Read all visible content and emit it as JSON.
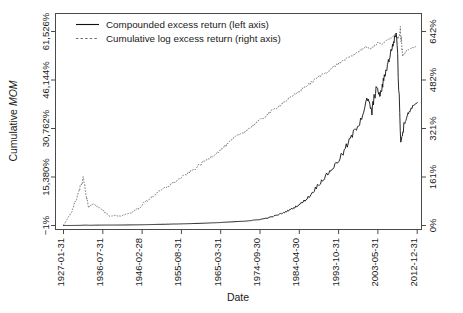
{
  "chart_data": {
    "type": "line",
    "title": "",
    "xlabel": "Date",
    "ylabel": "Cumulative MOM",
    "ylabel_plain": "Cumulative ",
    "ylabel_italic": "MOM",
    "grid": false,
    "legend_position": "top-left",
    "x_tick_labels": [
      "1927-01-31",
      "1936-07-31",
      "1946-02-28",
      "1955-08-31",
      "1965-03-31",
      "1974-09-30",
      "1984-04-30",
      "1993-10-31",
      "2003-05-31",
      "2012-12-31"
    ],
    "left_axis": {
      "label": "Cumulative MOM",
      "tick_labels": [
        "−1%",
        "15,380%",
        "30,762%",
        "46,144%",
        "61,526%"
      ],
      "tick_values": [
        -1,
        15380,
        30762,
        46144,
        61526
      ],
      "ylim": [
        -1,
        61526
      ],
      "units": "percent"
    },
    "right_axis": {
      "tick_labels": [
        "0%",
        "161%",
        "321%",
        "482%",
        "642%"
      ],
      "tick_values": [
        0,
        161,
        321,
        482,
        642
      ],
      "ylim": [
        0,
        642
      ],
      "units": "percent"
    },
    "series": [
      {
        "name": "Compounded excess return (left axis)",
        "axis": "left",
        "style": "solid",
        "color": "#111111",
        "x": [
          1927.08,
          1929.0,
          1931.0,
          1932.5,
          1933.5,
          1935.0,
          1937.0,
          1939.0,
          1941.0,
          1943.0,
          1945.0,
          1947.0,
          1949.0,
          1951.0,
          1953.0,
          1955.0,
          1957.0,
          1959.0,
          1961.0,
          1963.0,
          1965.0,
          1967.0,
          1969.0,
          1971.0,
          1973.0,
          1975.0,
          1977.0,
          1979.0,
          1981.0,
          1983.0,
          1985.0,
          1987.0,
          1989.0,
          1991.0,
          1993.0,
          1995.0,
          1997.0,
          1999.0,
          2001.0,
          2002.0,
          2003.0,
          2004.0,
          2005.0,
          2006.0,
          2007.0,
          2008.0,
          2009.0,
          2010.0,
          2011.0,
          2012.0,
          2013.0
        ],
        "y": [
          0,
          10,
          40,
          120,
          60,
          110,
          130,
          140,
          150,
          180,
          210,
          260,
          320,
          380,
          430,
          500,
          560,
          640,
          720,
          820,
          930,
          1080,
          1220,
          1380,
          1620,
          1950,
          2500,
          3300,
          4300,
          5600,
          7200,
          9500,
          13000,
          16000,
          19000,
          23000,
          28000,
          33000,
          40000,
          36000,
          44000,
          41000,
          47000,
          52000,
          57000,
          61500,
          27000,
          33000,
          36000,
          38000,
          39000
        ]
      },
      {
        "name": "Cumulative log excess return (right axis)",
        "axis": "right",
        "style": "dashed",
        "color": "#6b6b6b",
        "x": [
          1927.08,
          1928.0,
          1929.0,
          1930.0,
          1931.0,
          1932.0,
          1932.6,
          1933.2,
          1933.8,
          1934.5,
          1935.5,
          1936.5,
          1937.5,
          1938.5,
          1939.5,
          1940.5,
          1941.5,
          1942.5,
          1943.5,
          1945.0,
          1947.0,
          1949.0,
          1951.0,
          1953.0,
          1955.0,
          1957.0,
          1959.0,
          1961.0,
          1963.0,
          1965.0,
          1967.0,
          1969.0,
          1971.0,
          1973.0,
          1975.0,
          1977.0,
          1979.0,
          1981.0,
          1983.0,
          1985.0,
          1987.0,
          1989.0,
          1991.0,
          1993.0,
          1995.0,
          1997.0,
          1999.0,
          2000.5,
          2001.5,
          2002.5,
          2003.5,
          2004.5,
          2005.5,
          2006.5,
          2007.5,
          2008.4,
          2008.9,
          2009.5,
          2010.5,
          2011.5,
          2012.5,
          2013.0
        ],
        "y": [
          0,
          20,
          45,
          80,
          120,
          158,
          95,
          60,
          68,
          72,
          60,
          52,
          40,
          30,
          34,
          30,
          34,
          38,
          42,
          55,
          78,
          100,
          118,
          135,
          152,
          170,
          188,
          210,
          228,
          248,
          270,
          295,
          310,
          330,
          350,
          372,
          392,
          412,
          430,
          452,
          470,
          492,
          508,
          528,
          546,
          560,
          578,
          592,
          584,
          592,
          606,
          598,
          612,
          620,
          630,
          618,
          642,
          560,
          580,
          586,
          592,
          590
        ]
      }
    ],
    "annotations": []
  },
  "legend": {
    "entries": [
      {
        "label": "Compounded excess return (left axis)",
        "style": "solid"
      },
      {
        "label": "Cumulative log excess return (right axis)",
        "style": "dashed"
      }
    ]
  }
}
